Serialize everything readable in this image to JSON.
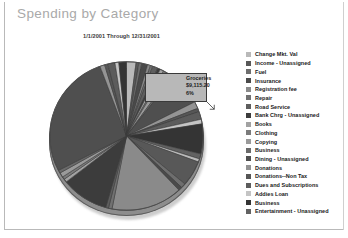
{
  "report": {
    "title": "Spending by Category",
    "date_range": "1/1/2001 Through 12/31/2001"
  },
  "callout": {
    "category": "Groceries",
    "amount": "$9,115.20",
    "percent": "6%"
  },
  "legend": {
    "items": [
      {
        "label": "Change Mkt. Val",
        "color": "#b9b9b9"
      },
      {
        "label": "Income - Unassigned",
        "color": "#585858"
      },
      {
        "label": "Fuel",
        "color": "#6e6e6e"
      },
      {
        "label": "Insurance",
        "color": "#4a4a4a"
      },
      {
        "label": "Registration fee",
        "color": "#8a8a8a"
      },
      {
        "label": "Repair",
        "color": "#717171"
      },
      {
        "label": "Road Service",
        "color": "#5e5e5e"
      },
      {
        "label": "Bank Chrg - Unassigned",
        "color": "#3c3c3c"
      },
      {
        "label": "Books",
        "color": "#a2a2a2"
      },
      {
        "label": "Clothing",
        "color": "#7b7b7b"
      },
      {
        "label": "Copying",
        "color": "#9a9a9a"
      },
      {
        "label": "Business",
        "color": "#6a6a6a"
      },
      {
        "label": "Dining - Unassigned",
        "color": "#4f4f4f"
      },
      {
        "label": "Donations",
        "color": "#949494"
      },
      {
        "label": "Donations--Non Tax",
        "color": "#565656"
      },
      {
        "label": "Dues and Subscriptions",
        "color": "#5c5c5c"
      },
      {
        "label": "Addies Loan",
        "color": "#c4c4c4"
      },
      {
        "label": "Business",
        "color": "#343434"
      },
      {
        "label": "Entertainment - Unassigned",
        "color": "#626262"
      }
    ]
  },
  "chart_data": {
    "type": "pie",
    "title": "Spending by Category",
    "subtitle": "1/1/2001 Through 12/31/2001",
    "legend_position": "right",
    "grid": false,
    "highlighted_slice": {
      "label": "Groceries",
      "value": 9115.2,
      "percent": 6,
      "value_label": "$9,115.20",
      "percent_label": "6%"
    },
    "categories": [
      "Change Mkt. Val",
      "Income - Unassigned",
      "Fuel",
      "Insurance",
      "Registration fee",
      "Repair",
      "Road Service",
      "Bank Chrg - Unassigned",
      "Books",
      "Clothing",
      "Copying",
      "Business",
      "Dining - Unassigned",
      "Donations",
      "Donations--Non Tax",
      "Dues and Subscriptions",
      "Addies Loan",
      "Business",
      "Entertainment - Unassigned"
    ],
    "values": [
      6,
      1,
      2,
      1,
      1,
      1,
      1,
      1,
      1,
      1,
      1,
      1,
      2,
      1,
      1,
      1,
      22,
      1,
      10
    ],
    "slices": [
      {
        "label": "Change Mkt. Val",
        "percent": 6,
        "color": "#b9b9b9"
      },
      {
        "label": "Income - Unassigned",
        "percent": 1,
        "color": "#585858"
      },
      {
        "label": "Fuel",
        "percent": 2,
        "color": "#6e6e6e"
      },
      {
        "label": "Insurance",
        "percent": 1,
        "color": "#4a4a4a"
      },
      {
        "label": "Registration fee",
        "percent": 1,
        "color": "#8a8a8a"
      },
      {
        "label": "Repair",
        "percent": 1,
        "color": "#717171"
      },
      {
        "label": "Road Service",
        "percent": 1,
        "color": "#5e5e5e"
      },
      {
        "label": "Bank Chrg - Unassigned",
        "percent": 1,
        "color": "#3c3c3c"
      },
      {
        "label": "Books",
        "percent": 1,
        "color": "#a2a2a2"
      },
      {
        "label": "Clothing",
        "percent": 1,
        "color": "#7b7b7b"
      },
      {
        "label": "Copying",
        "percent": 1,
        "color": "#9a9a9a"
      },
      {
        "label": "Business",
        "percent": 1,
        "color": "#6a6a6a"
      },
      {
        "label": "Dining - Unassigned",
        "percent": 2,
        "color": "#4f4f4f"
      },
      {
        "label": "Donations",
        "percent": 1,
        "color": "#949494"
      },
      {
        "label": "Donations--Non Tax",
        "percent": 1,
        "color": "#565656"
      },
      {
        "label": "Dues and Subscriptions",
        "percent": 1,
        "color": "#5c5c5c"
      },
      {
        "label": "Addies Loan",
        "percent": 22,
        "color": "#c4c4c4"
      },
      {
        "label": "Business",
        "percent": 1,
        "color": "#343434"
      },
      {
        "label": "Entertainment - Unassigned",
        "percent": 10,
        "color": "#626262"
      }
    ]
  }
}
